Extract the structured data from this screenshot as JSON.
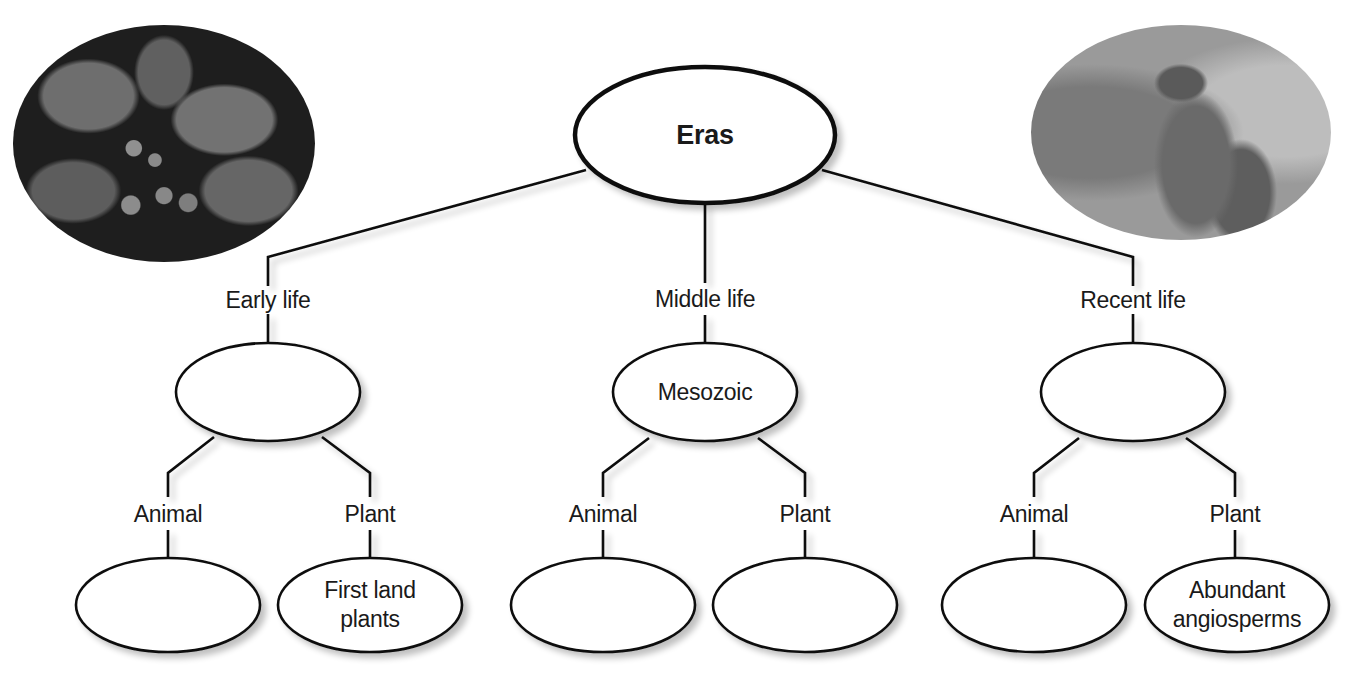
{
  "root": {
    "label": "Eras"
  },
  "eras": [
    {
      "branch_label": "Early life",
      "era_name": "",
      "children": [
        {
          "branch_label": "Animal",
          "text": ""
        },
        {
          "branch_label": "Plant",
          "text": "First land\nplants",
          "line1": "First land",
          "line2": "plants"
        }
      ]
    },
    {
      "branch_label": "Middle life",
      "era_name": "Mesozoic",
      "children": [
        {
          "branch_label": "Animal",
          "text": ""
        },
        {
          "branch_label": "Plant",
          "text": ""
        }
      ]
    },
    {
      "branch_label": "Recent life",
      "era_name": "",
      "children": [
        {
          "branch_label": "Animal",
          "text": ""
        },
        {
          "branch_label": "Plant",
          "text": "Abundant\nangiosperms",
          "line1": "Abundant",
          "line2": "angiosperms"
        }
      ]
    }
  ],
  "images": [
    {
      "subject": "ginkgo-leaves-and-seeds-photo",
      "position": "top-left"
    },
    {
      "subject": "kangaroo-photo",
      "position": "top-right"
    }
  ],
  "colors": {
    "stroke": "#111111",
    "fill": "#ffffff",
    "text": "#1a1a1a"
  }
}
